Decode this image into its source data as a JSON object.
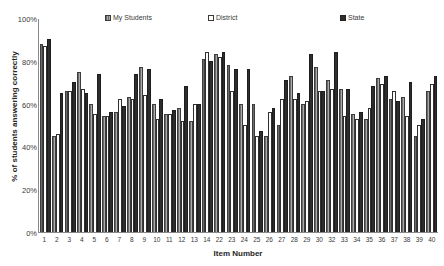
{
  "chart_data": {
    "type": "bar",
    "title": "",
    "xlabel": "Item Number",
    "ylabel": "% of students answering correctly",
    "ylim": [
      0,
      100
    ],
    "yticks": [
      "100%",
      "80%",
      "60%",
      "40%",
      "20%",
      "0%"
    ],
    "ytick_values": [
      100,
      80,
      60,
      40,
      20,
      0
    ],
    "grid": false,
    "legend_position": "top",
    "categories": [
      "1",
      "2",
      "3",
      "4",
      "5",
      "6",
      "7",
      "8",
      "9",
      "10",
      "11",
      "12",
      "13",
      "14",
      "22",
      "23",
      "24",
      "25",
      "26",
      "27",
      "28",
      "29",
      "30",
      "32",
      "33",
      "34",
      "35",
      "36",
      "37",
      "38",
      "39",
      "40"
    ],
    "series": [
      {
        "name": "My Students",
        "color": "#8d8d8d",
        "values": [
          88,
          45,
          66,
          75,
          60,
          54,
          56,
          63,
          77,
          60,
          55,
          58,
          52,
          81,
          83,
          78,
          60,
          60,
          45,
          50,
          73,
          60,
          77,
          71,
          67,
          55,
          53,
          72,
          62,
          63,
          45,
          66
        ]
      },
      {
        "name": "District",
        "color": "#ffffff",
        "values": [
          87,
          46,
          66,
          67,
          55,
          54,
          62,
          62,
          64,
          53,
          55,
          52,
          60,
          84,
          82,
          66,
          50,
          45,
          56,
          62,
          62,
          61,
          66,
          67,
          54,
          53,
          58,
          69,
          66,
          54,
          50,
          69
        ]
      },
      {
        "name": "State",
        "color": "#2e2e2e",
        "values": [
          90,
          65,
          70,
          65,
          74,
          56,
          59,
          74,
          76,
          62,
          57,
          68,
          60,
          80,
          84,
          76,
          76,
          47,
          58,
          71,
          65,
          83,
          66,
          84,
          67,
          56,
          68,
          73,
          61,
          70,
          53,
          73
        ]
      }
    ]
  },
  "legend": {
    "entries": [
      {
        "label": "My Students",
        "swatch": "hatched-gray-swatch-icon"
      },
      {
        "label": "District",
        "swatch": "open-white-swatch-icon"
      },
      {
        "label": "State",
        "swatch": "solid-dark-swatch-icon"
      }
    ]
  }
}
